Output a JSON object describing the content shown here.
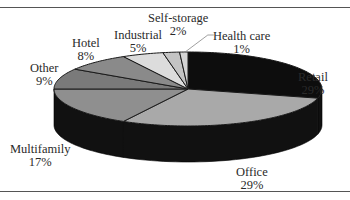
{
  "chart_data": {
    "type": "pie",
    "style": "3d",
    "title": "",
    "categories": [
      "Retail",
      "Office",
      "Multifamily",
      "Other",
      "Hotel",
      "Industrial",
      "Self-storage",
      "Health care"
    ],
    "values": [
      29,
      29,
      17,
      9,
      8,
      5,
      2,
      1
    ],
    "unit": "%",
    "colors": [
      "#0d0d0d",
      "#a9a9a9",
      "#8f8f8f",
      "#7a7a7a",
      "#8a8a8a",
      "#dcdcdc",
      "#c4c4c4",
      "#d4d4d4"
    ],
    "start_angle": "top",
    "direction": "clockwise",
    "legend": "none (direct labels)"
  },
  "labels": {
    "retail": {
      "name": "Retail",
      "pct": "29%"
    },
    "office": {
      "name": "Office",
      "pct": "29%"
    },
    "multifamily": {
      "name": "Multifamily",
      "pct": "17%"
    },
    "other": {
      "name": "Other",
      "pct": "9%"
    },
    "hotel": {
      "name": "Hotel",
      "pct": "8%"
    },
    "industrial": {
      "name": "Industrial",
      "pct": "5%"
    },
    "self_storage": {
      "name": "Self-storage",
      "pct": "2%"
    },
    "health_care": {
      "name": "Health care",
      "pct": "1%"
    }
  }
}
